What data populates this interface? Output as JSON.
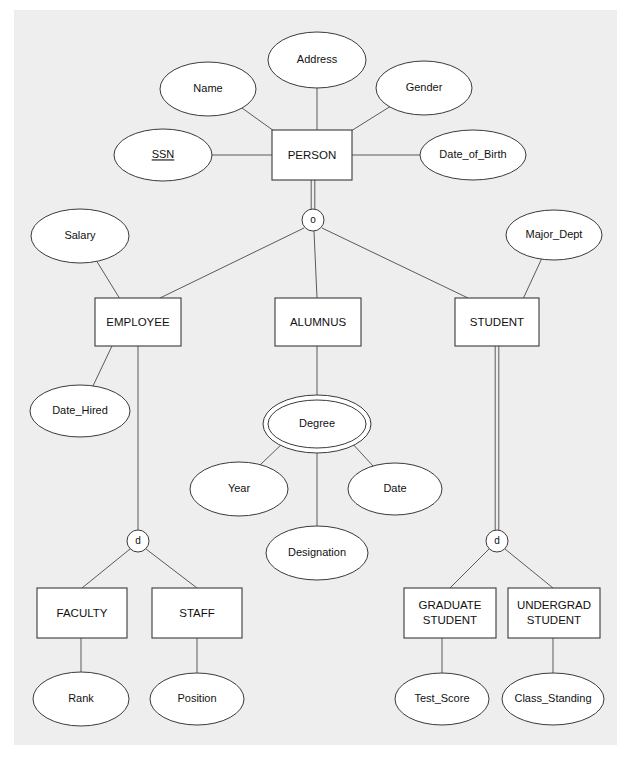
{
  "diagram": {
    "notation": "Chen / EER",
    "background_color": "#eeeeee",
    "page_color": "#ffffff",
    "line_color": "#5a5a5a",
    "shape_fill": "#ffffff",
    "shape_stroke": "#3a3a3a",
    "text_color": "#111111"
  },
  "entities": [
    {
      "id": "person",
      "label": "PERSON",
      "x": 272,
      "y": 130,
      "w": 80,
      "h": 50
    },
    {
      "id": "employee",
      "label": "EMPLOYEE",
      "x": 95,
      "y": 298,
      "w": 86,
      "h": 48
    },
    {
      "id": "alumnus",
      "label": "ALUMNUS",
      "x": 275,
      "y": 298,
      "w": 86,
      "h": 48
    },
    {
      "id": "student",
      "label": "STUDENT",
      "x": 455,
      "y": 298,
      "w": 84,
      "h": 48
    },
    {
      "id": "faculty",
      "label": "FACULTY",
      "x": 37,
      "y": 588,
      "w": 90,
      "h": 50
    },
    {
      "id": "staff",
      "label": "STAFF",
      "x": 152,
      "y": 588,
      "w": 90,
      "h": 50
    },
    {
      "id": "grad",
      "label": "GRADUATE STUDENT",
      "line1": "GRADUATE",
      "line2": "STUDENT",
      "x": 404,
      "y": 588,
      "w": 92,
      "h": 50
    },
    {
      "id": "undergrad",
      "label": "UNDERGRAD STUDENT",
      "line1": "UNDERGRAD",
      "line2": "STUDENT",
      "x": 508,
      "y": 588,
      "w": 92,
      "h": 50
    }
  ],
  "attributes": [
    {
      "id": "address",
      "label": "Address",
      "cx": 317,
      "cy": 60,
      "rx": 49,
      "ry": 28,
      "kind": "simple",
      "owner": "person"
    },
    {
      "id": "name",
      "label": "Name",
      "cx": 208,
      "cy": 89,
      "rx": 48,
      "ry": 27,
      "kind": "simple",
      "owner": "person"
    },
    {
      "id": "gender",
      "label": "Gender",
      "cx": 424,
      "cy": 88,
      "rx": 48,
      "ry": 27,
      "kind": "simple",
      "owner": "person"
    },
    {
      "id": "ssn",
      "label": "SSN",
      "cx": 163,
      "cy": 155,
      "rx": 49,
      "ry": 26,
      "kind": "key",
      "owner": "person"
    },
    {
      "id": "date_of_birth",
      "label": "Date_of_Birth",
      "cx": 473,
      "cy": 155,
      "rx": 53,
      "ry": 25,
      "kind": "simple",
      "owner": "person"
    },
    {
      "id": "salary",
      "label": "Salary",
      "cx": 80,
      "cy": 236,
      "rx": 49,
      "ry": 27,
      "kind": "simple",
      "owner": "employee"
    },
    {
      "id": "major_dept",
      "label": "Major_Dept",
      "cx": 554,
      "cy": 235,
      "rx": 48,
      "ry": 25,
      "kind": "simple",
      "owner": "student"
    },
    {
      "id": "date_hired",
      "label": "Date_Hired",
      "cx": 80,
      "cy": 411,
      "rx": 50,
      "ry": 26,
      "kind": "simple",
      "owner": "employee"
    },
    {
      "id": "degree",
      "label": "Degree",
      "cx": 317,
      "cy": 424,
      "rx": 49,
      "ry": 24,
      "kind": "multivalued",
      "owner": "alumnus"
    },
    {
      "id": "year",
      "label": "Year",
      "cx": 239,
      "cy": 489,
      "rx": 49,
      "ry": 27,
      "kind": "simple",
      "owner": "degree"
    },
    {
      "id": "date",
      "label": "Date",
      "cx": 395,
      "cy": 489,
      "rx": 47,
      "ry": 26,
      "kind": "simple",
      "owner": "degree"
    },
    {
      "id": "designation",
      "label": "Designation",
      "cx": 317,
      "cy": 553,
      "rx": 51,
      "ry": 27,
      "kind": "simple",
      "owner": "degree"
    },
    {
      "id": "rank",
      "label": "Rank",
      "cx": 81,
      "cy": 699,
      "rx": 48,
      "ry": 27,
      "kind": "simple",
      "owner": "faculty"
    },
    {
      "id": "position",
      "label": "Position",
      "cx": 197,
      "cy": 699,
      "rx": 47,
      "ry": 26,
      "kind": "simple",
      "owner": "staff"
    },
    {
      "id": "test_score",
      "label": "Test_Score",
      "cx": 442,
      "cy": 699,
      "rx": 47,
      "ry": 26,
      "kind": "simple",
      "owner": "grad"
    },
    {
      "id": "class_standing",
      "label": "Class_Standing",
      "cx": 553,
      "cy": 699,
      "rx": 51,
      "ry": 26,
      "kind": "simple",
      "owner": "undergrad"
    }
  ],
  "specializations": [
    {
      "id": "person-spec",
      "symbol": "o",
      "meaning": "overlapping",
      "cx": 313,
      "cy": 220,
      "r": 11,
      "superclass": "PERSON",
      "subclasses": [
        "EMPLOYEE",
        "ALUMNUS",
        "STUDENT"
      ],
      "participation": "total"
    },
    {
      "id": "employee-spec",
      "symbol": "d",
      "meaning": "disjoint",
      "cx": 138,
      "cy": 541,
      "r": 11,
      "superclass": "EMPLOYEE",
      "subclasses": [
        "FACULTY",
        "STAFF"
      ],
      "participation": "partial"
    },
    {
      "id": "student-spec",
      "symbol": "d",
      "meaning": "disjoint",
      "cx": 497,
      "cy": 541,
      "r": 11,
      "superclass": "STUDENT",
      "subclasses": [
        "GRADUATE STUDENT",
        "UNDERGRAD STUDENT"
      ],
      "participation": "total"
    }
  ],
  "edges": [
    {
      "id": "e-address-person",
      "from": "Address",
      "to": "PERSON",
      "x1": 317,
      "y1": 88,
      "x2": 317,
      "y2": 130,
      "style": "single"
    },
    {
      "id": "e-name-person",
      "from": "Name",
      "to": "PERSON",
      "x1": 242,
      "y1": 108,
      "x2": 274,
      "y2": 131,
      "style": "single"
    },
    {
      "id": "e-gender-person",
      "from": "Gender",
      "to": "PERSON",
      "x1": 391,
      "y1": 106,
      "x2": 351,
      "y2": 131,
      "style": "single"
    },
    {
      "id": "e-ssn-person",
      "from": "SSN",
      "to": "PERSON",
      "x1": 212,
      "y1": 155,
      "x2": 272,
      "y2": 155,
      "style": "single"
    },
    {
      "id": "e-dob-person",
      "from": "Date_of_Birth",
      "to": "PERSON",
      "x1": 352,
      "y1": 155,
      "x2": 420,
      "y2": 155,
      "style": "single"
    },
    {
      "id": "e-person-spec",
      "from": "PERSON",
      "to": "person-spec",
      "x1": 313,
      "y1": 180,
      "x2": 313,
      "y2": 209,
      "style": "double"
    },
    {
      "id": "e-spec-employee",
      "from": "person-spec",
      "to": "EMPLOYEE",
      "x1": 304,
      "y1": 228,
      "x2": 160,
      "y2": 298,
      "style": "single"
    },
    {
      "id": "e-spec-alumnus",
      "from": "person-spec",
      "to": "ALUMNUS",
      "x1": 314,
      "y1": 231,
      "x2": 317,
      "y2": 298,
      "style": "single"
    },
    {
      "id": "e-spec-student",
      "from": "person-spec",
      "to": "STUDENT",
      "x1": 322,
      "y1": 228,
      "x2": 468,
      "y2": 298,
      "style": "single"
    },
    {
      "id": "e-salary-employee",
      "from": "Salary",
      "to": "EMPLOYEE",
      "x1": 96,
      "y1": 260,
      "x2": 120,
      "y2": 299,
      "style": "single"
    },
    {
      "id": "e-majordept-stud",
      "from": "Major_Dept",
      "to": "STUDENT",
      "x1": 542,
      "y1": 258,
      "x2": 523,
      "y2": 299,
      "style": "single"
    },
    {
      "id": "e-employee-dhired",
      "from": "EMPLOYEE",
      "to": "Date_Hired",
      "x1": 112,
      "y1": 346,
      "x2": 92,
      "y2": 388,
      "style": "single"
    },
    {
      "id": "e-employee-spec",
      "from": "EMPLOYEE",
      "to": "employee-spec",
      "x1": 138,
      "y1": 346,
      "x2": 138,
      "y2": 530,
      "style": "single"
    },
    {
      "id": "e-alumnus-degree",
      "from": "ALUMNUS",
      "to": "Degree",
      "x1": 317,
      "y1": 346,
      "x2": 317,
      "y2": 398,
      "style": "single"
    },
    {
      "id": "e-student-spec",
      "from": "STUDENT",
      "to": "student-spec",
      "x1": 497,
      "y1": 346,
      "x2": 497,
      "y2": 530,
      "style": "double"
    },
    {
      "id": "e-degree-year",
      "from": "Degree",
      "to": "Year",
      "x1": 285,
      "y1": 441,
      "x2": 259,
      "y2": 466,
      "style": "single"
    },
    {
      "id": "e-degree-date",
      "from": "Degree",
      "to": "Date",
      "x1": 350,
      "y1": 441,
      "x2": 374,
      "y2": 467,
      "style": "single"
    },
    {
      "id": "e-degree-design",
      "from": "Degree",
      "to": "Designation",
      "x1": 317,
      "y1": 448,
      "x2": 317,
      "y2": 526,
      "style": "single"
    },
    {
      "id": "e-empspec-faculty",
      "from": "employee-spec",
      "to": "FACULTY",
      "x1": 130,
      "y1": 549,
      "x2": 82,
      "y2": 588,
      "style": "single"
    },
    {
      "id": "e-empspec-staff",
      "from": "employee-spec",
      "to": "STAFF",
      "x1": 146,
      "y1": 549,
      "x2": 197,
      "y2": 588,
      "style": "single"
    },
    {
      "id": "e-faculty-rank",
      "from": "FACULTY",
      "to": "Rank",
      "x1": 81,
      "y1": 638,
      "x2": 81,
      "y2": 672,
      "style": "single"
    },
    {
      "id": "e-staff-position",
      "from": "STAFF",
      "to": "Position",
      "x1": 197,
      "y1": 638,
      "x2": 197,
      "y2": 673,
      "style": "single"
    },
    {
      "id": "e-stuspec-grad",
      "from": "student-spec",
      "to": "GRADUATE STUDENT",
      "x1": 489,
      "y1": 549,
      "x2": 450,
      "y2": 588,
      "style": "single"
    },
    {
      "id": "e-stuspec-ugrad",
      "from": "student-spec",
      "to": "UNDERGRAD STUDENT",
      "x1": 505,
      "y1": 549,
      "x2": 553,
      "y2": 588,
      "style": "single"
    },
    {
      "id": "e-grad-testscore",
      "from": "GRADUATE STUDENT",
      "to": "Test_Score",
      "x1": 442,
      "y1": 638,
      "x2": 442,
      "y2": 673,
      "style": "single"
    },
    {
      "id": "e-ugrad-classstand",
      "from": "UNDERGRAD STUDENT",
      "to": "Class_Standing",
      "x1": 553,
      "y1": 638,
      "x2": 553,
      "y2": 673,
      "style": "single"
    }
  ]
}
